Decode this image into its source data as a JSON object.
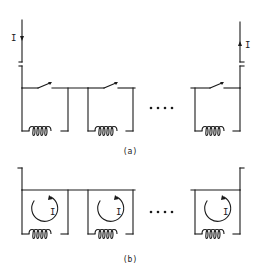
{
  "figure": {
    "panel_a": {
      "label": "(a)",
      "current_in_label": "I",
      "current_out_label": "I",
      "loop_count_visible": 3,
      "ellipsis": "....",
      "description": "Series chain of superconducting loops, each with an open persistent-current switch and a coil"
    },
    "panel_b": {
      "label": "(b)",
      "loop_current_labels": [
        "I",
        "I",
        "I"
      ],
      "loop_count_visible": 3,
      "ellipsis": "....",
      "description": "Switches closed; each loop carries a circulating persistent current I"
    },
    "colors": {
      "ink": "#1a1a1a",
      "background": "#ffffff"
    }
  }
}
